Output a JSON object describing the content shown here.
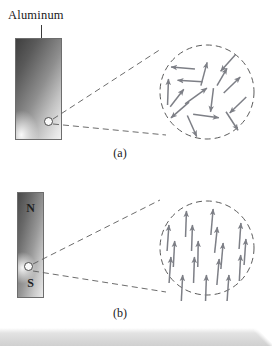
{
  "figure": {
    "title_label": "Aluminum",
    "captions": {
      "a": "(a)",
      "b": "(b)"
    },
    "colors": {
      "arrow": "#7d7f86",
      "dashed_circle": "#5b5b5b",
      "leader": "#4a4a4a",
      "bar_outline": "#6d6d6d",
      "text": "#1a1a1a"
    }
  },
  "panel_a": {
    "material_label": "Aluminum",
    "caption": "(a)",
    "bar": {
      "x": 15,
      "y": 38,
      "w": 47,
      "h": 102
    },
    "zoom_dot": {
      "cx": 48.5,
      "cy": 121.5,
      "r": 4.5
    },
    "magnify_circle": {
      "cx": 207,
      "cy": 92,
      "r": 47
    },
    "cone": {
      "upper": "53,119 161,49",
      "lower": "53,124 166,135"
    },
    "domain_state": "randomly oriented",
    "arrows": [
      {
        "x": 204,
        "y": 74,
        "angle": -75,
        "len": 24
      },
      {
        "x": 228,
        "y": 63,
        "angle": 132,
        "len": 22
      },
      {
        "x": 183,
        "y": 68,
        "angle": 185,
        "len": 24
      },
      {
        "x": 190,
        "y": 81,
        "angle": 183,
        "len": 25
      },
      {
        "x": 232,
        "y": 85,
        "angle": -44,
        "len": 23
      },
      {
        "x": 168,
        "y": 92,
        "angle": -88,
        "len": 26
      },
      {
        "x": 196,
        "y": 96,
        "angle": -36,
        "len": 27
      },
      {
        "x": 212,
        "y": 100,
        "angle": 97,
        "len": 24
      },
      {
        "x": 238,
        "y": 105,
        "angle": 136,
        "len": 23
      },
      {
        "x": 180,
        "y": 110,
        "angle": 139,
        "len": 24
      },
      {
        "x": 206,
        "y": 116,
        "angle": 8,
        "len": 26
      },
      {
        "x": 232,
        "y": 121,
        "angle": 57,
        "len": 22
      },
      {
        "x": 192,
        "y": 126,
        "angle": 66,
        "len": 23
      },
      {
        "x": 177,
        "y": 98,
        "angle": -52,
        "len": 22
      },
      {
        "x": 222,
        "y": 77,
        "angle": -60,
        "len": 20
      }
    ]
  },
  "panel_b": {
    "caption": "(b)",
    "pole_north": "N",
    "pole_south": "S",
    "bar": {
      "x": 17,
      "y": 192,
      "w": 27,
      "h": 106
    },
    "zoom_dot": {
      "cx": 28.5,
      "cy": 266.5,
      "r": 4.5
    },
    "magnify_circle": {
      "cx": 207,
      "cy": 248,
      "r": 47
    },
    "cone": {
      "upper": "33,264 160,200"
    },
    "cone_lower": "33,271 166,292",
    "domain_state": "aligned",
    "arrows": [
      {
        "x": 186,
        "y": 224,
        "angle": -88,
        "len": 26
      },
      {
        "x": 212,
        "y": 222,
        "angle": -85,
        "len": 26
      },
      {
        "x": 168,
        "y": 238,
        "angle": -86,
        "len": 26
      },
      {
        "x": 192,
        "y": 238,
        "angle": -88,
        "len": 26
      },
      {
        "x": 216,
        "y": 240,
        "angle": -84,
        "len": 26
      },
      {
        "x": 240,
        "y": 236,
        "angle": -86,
        "len": 26
      },
      {
        "x": 174,
        "y": 254,
        "angle": -87,
        "len": 26
      },
      {
        "x": 198,
        "y": 254,
        "angle": -89,
        "len": 26
      },
      {
        "x": 222,
        "y": 256,
        "angle": -85,
        "len": 26
      },
      {
        "x": 245,
        "y": 252,
        "angle": -86,
        "len": 26
      },
      {
        "x": 170,
        "y": 270,
        "angle": -86,
        "len": 26
      },
      {
        "x": 194,
        "y": 270,
        "angle": -88,
        "len": 26
      },
      {
        "x": 218,
        "y": 272,
        "angle": -85,
        "len": 26
      },
      {
        "x": 240,
        "y": 268,
        "angle": -87,
        "len": 26
      },
      {
        "x": 182,
        "y": 288,
        "angle": -87,
        "len": 26
      },
      {
        "x": 206,
        "y": 288,
        "angle": -88,
        "len": 26
      },
      {
        "x": 228,
        "y": 288,
        "angle": -86,
        "len": 26
      }
    ]
  }
}
